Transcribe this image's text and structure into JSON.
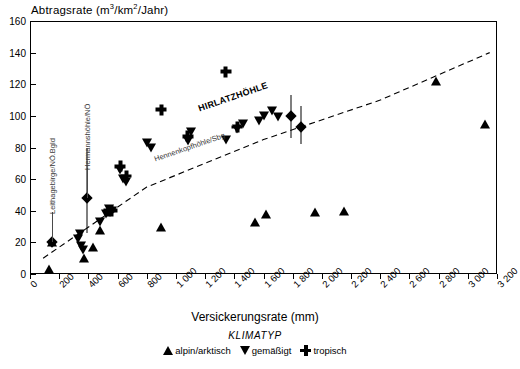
{
  "chart_data": {
    "type": "scatter",
    "title": "Abtragsrate (m3/km2/Jahr)",
    "title_main": "Abtragsrate (m",
    "title_sup1": "3",
    "title_mid": "/km",
    "title_sup2": "2",
    "title_end": "/Jahr)",
    "xlabel": "Versickerungsrate (mm)",
    "ylabel": "Abtragsrate (m3/km2/Jahr)",
    "xlim": [
      0,
      3200
    ],
    "ylim": [
      0,
      160
    ],
    "grid": false,
    "legend_position": "below-axis",
    "legend_title": "KLIMATYP",
    "xticks": [
      0,
      200,
      400,
      600,
      800,
      1000,
      1200,
      1400,
      1600,
      1800,
      2000,
      2200,
      2400,
      2600,
      2800,
      3000,
      3200
    ],
    "xtick_labels": [
      "0",
      "200",
      "400",
      "600",
      "800",
      "1 000",
      "1 200",
      "1 400",
      "1 600",
      "1 800",
      "2 000",
      "2 200",
      "2 400",
      "2 600",
      "2 800",
      "3 000",
      "3 200"
    ],
    "yticks": [
      0,
      20,
      40,
      60,
      80,
      100,
      120,
      140,
      160
    ],
    "ytick_labels": [
      "0",
      "20",
      "40",
      "60",
      "80",
      "100",
      "120",
      "140",
      "160"
    ],
    "series": [
      {
        "name": "alpin/arktisch",
        "marker": "triangle-up",
        "points": [
          [
            130,
            3
          ],
          [
            150,
            20
          ],
          [
            370,
            10
          ],
          [
            430,
            17
          ],
          [
            480,
            28
          ],
          [
            900,
            30
          ],
          [
            1540,
            33
          ],
          [
            1620,
            38
          ],
          [
            1950,
            39
          ],
          [
            2150,
            40
          ],
          [
            2780,
            122
          ],
          [
            3120,
            95
          ]
        ]
      },
      {
        "name": "gemaessigt",
        "marker": "triangle-down",
        "points": [
          [
            330,
            22
          ],
          [
            345,
            25
          ],
          [
            350,
            18
          ],
          [
            360,
            15
          ],
          [
            480,
            33
          ],
          [
            520,
            38
          ],
          [
            540,
            41
          ],
          [
            560,
            40
          ],
          [
            620,
            66
          ],
          [
            640,
            60
          ],
          [
            660,
            58
          ],
          [
            800,
            83
          ],
          [
            830,
            80
          ],
          [
            1080,
            84
          ],
          [
            1100,
            90
          ],
          [
            1340,
            85
          ],
          [
            1420,
            92
          ],
          [
            1460,
            95
          ],
          [
            1570,
            97
          ],
          [
            1600,
            100
          ],
          [
            1660,
            103
          ],
          [
            1700,
            99
          ]
        ]
      },
      {
        "name": "tropisch",
        "marker": "plus",
        "points": [
          [
            620,
            68
          ],
          [
            660,
            62
          ],
          [
            900,
            104
          ],
          [
            1080,
            87
          ],
          [
            1340,
            128
          ],
          [
            1420,
            93
          ],
          [
            540,
            40
          ],
          [
            560,
            40
          ]
        ]
      },
      {
        "name": "Messpunkte mit Fehlerbalken",
        "marker": "diamond",
        "points": [
          [
            150,
            20
          ],
          [
            390,
            48
          ],
          [
            1790,
            100
          ],
          [
            1860,
            93
          ]
        ],
        "errorbars": [
          {
            "x": 390,
            "y": 48,
            "ylow": 26,
            "yhigh": 80
          },
          {
            "x": 1790,
            "y": 100,
            "ylow": 86,
            "yhigh": 113
          },
          {
            "x": 1860,
            "y": 93,
            "ylow": 82,
            "yhigh": 106
          }
        ]
      }
    ],
    "trendline": {
      "style": "dashed",
      "description": "ansteigende gestrichelte Trendkurve",
      "points": [
        [
          90,
          10
        ],
        [
          800,
          55
        ],
        [
          1600,
          85
        ],
        [
          2400,
          110
        ],
        [
          3150,
          140
        ]
      ]
    },
    "annotations": [
      {
        "text": "Leithagebirge/NÖ.Bgld",
        "orientation": "vertical",
        "x": 150,
        "y": 20
      },
      {
        "text": "Hermannshöhle/NÖ",
        "orientation": "vertical",
        "x": 390,
        "y": 48
      },
      {
        "text": "Hennenkopfhöhle/Sbg",
        "orientation": "diagonal",
        "x": 1500,
        "y": 78
      },
      {
        "text": "HIRLATZHÖHLE",
        "orientation": "diagonal",
        "bold": true,
        "x": 1800,
        "y": 110
      }
    ],
    "legend_entries": [
      {
        "symbol": "triangle-up",
        "label": "alpin/arktisch"
      },
      {
        "symbol": "triangle-down",
        "label": "gemäßigt"
      },
      {
        "symbol": "plus",
        "label": "tropisch"
      }
    ]
  }
}
